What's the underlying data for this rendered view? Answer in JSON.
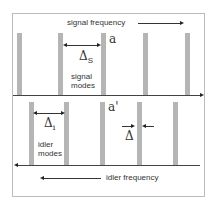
{
  "diagram": {
    "signal": {
      "label": "signal frequency",
      "modes_label_line1": "signal",
      "modes_label_line2": "modes",
      "spacing_symbol": "Δ",
      "spacing_sub": "S",
      "marker": "a"
    },
    "idler": {
      "label": "idler frequency",
      "modes_label_line1": "idler",
      "modes_label_line2": "modes",
      "spacing_symbol": "Δ",
      "spacing_sub": "i",
      "marker": "a'",
      "offset_symbol": "Δ"
    },
    "colors": {
      "bar": "#b5b5b5",
      "axis": "#444444",
      "border": "#bbbbbb"
    }
  }
}
